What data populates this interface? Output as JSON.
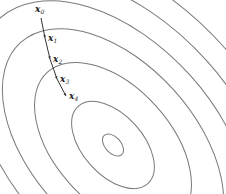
{
  "figure": {
    "center": [
      113,
      145
    ],
    "contours": [
      {
        "rx": 8,
        "ry": 13
      },
      {
        "rx": 30,
        "ry": 52
      },
      {
        "rx": 58,
        "ry": 98
      },
      {
        "rx": 82,
        "ry": 138
      },
      {
        "rx": 104,
        "ry": 170
      },
      {
        "rx": 126,
        "ry": 200
      },
      {
        "rx": 148,
        "ry": 230
      }
    ],
    "rotation_deg": -42,
    "colors": {
      "contour": "#7a7a7a",
      "path": "#333333"
    },
    "points": [
      {
        "label": "x",
        "sub": "0",
        "x": 41,
        "y": 18
      },
      {
        "label": "x",
        "sub": "1",
        "x": 45,
        "y": 38
      },
      {
        "label": "x",
        "sub": "2",
        "x": 50,
        "y": 59
      },
      {
        "label": "x",
        "sub": "3",
        "x": 57,
        "y": 79
      },
      {
        "label": "x",
        "sub": "4",
        "x": 66,
        "y": 96
      }
    ]
  }
}
